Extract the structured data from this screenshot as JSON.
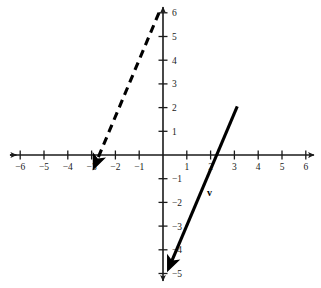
{
  "figure": {
    "width": 321,
    "height": 288,
    "background_color": "#ffffff",
    "axis_color": "#1a1a1a",
    "vector_color": "#000000"
  },
  "chart_data": {
    "type": "scatter",
    "title": "",
    "xlabel": "",
    "ylabel": "",
    "xlim": [
      -6.6,
      6.4
    ],
    "ylim": [
      -5.6,
      6.5
    ],
    "grid": false,
    "legend": null,
    "x_ticks": [
      -6,
      -5,
      -4,
      -3,
      -2,
      -1,
      1,
      2,
      3,
      4,
      5,
      6
    ],
    "x_tick_labels": [
      "−6",
      "−5",
      "−4",
      "−3",
      "−2",
      "−1",
      "1",
      "2",
      "3",
      "4",
      "5",
      "6"
    ],
    "y_ticks": [
      6,
      5,
      4,
      3,
      2,
      1,
      -1,
      -2,
      -3,
      -4,
      -5
    ],
    "y_tick_labels": [
      "6",
      "5",
      "4",
      "3",
      "2",
      "1",
      "−1",
      "−2",
      "−3",
      "−4",
      "−5"
    ],
    "origin": [
      0,
      0
    ],
    "series": [
      {
        "name": "v",
        "style": "solid",
        "kind": "vector-arrow",
        "label": "v",
        "label_position": [
          1.95,
          -1.75
        ],
        "tail": [
          3.12,
          2.05
        ],
        "tip": [
          0.17,
          -4.95
        ],
        "arrow_at": "tip"
      },
      {
        "name": "dashed-vector",
        "style": "dashed",
        "kind": "vector-arrow",
        "label": "",
        "label_position": null,
        "tail": [
          -0.17,
          6.0
        ],
        "tip": [
          -2.95,
          -0.65
        ],
        "arrow_at": "tip"
      }
    ],
    "annotations": [
      {
        "text": "v",
        "x": 1.95,
        "y": -1.75,
        "bold": true
      }
    ]
  }
}
